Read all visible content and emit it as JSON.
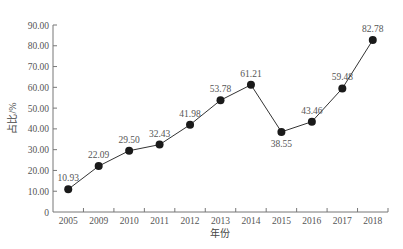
{
  "chart_data": {
    "type": "line",
    "title": "",
    "xlabel": "年份",
    "ylabel": "占比/%",
    "categories": [
      "2005",
      "2009",
      "2010",
      "2011",
      "2012",
      "2013",
      "2014",
      "2015",
      "2016",
      "2017",
      "2018"
    ],
    "series": [
      {
        "name": "占比",
        "values": [
          10.93,
          22.09,
          29.5,
          32.43,
          41.98,
          53.78,
          61.21,
          38.55,
          43.46,
          59.48,
          82.78
        ],
        "labels": [
          "10.93",
          "22.09",
          "29.50",
          "32.43",
          "41.98",
          "53.78",
          "61.21",
          "38.55",
          "43.46",
          "59.48",
          "82.78"
        ],
        "label_position": [
          "above",
          "above",
          "above",
          "above",
          "above",
          "above",
          "above",
          "below",
          "above",
          "above",
          "above"
        ]
      }
    ],
    "ylim": [
      0,
      90
    ],
    "yticks": [
      "0",
      "10.00",
      "20.00",
      "30.00",
      "40.00",
      "50.00",
      "60.00",
      "70.00",
      "80.00",
      "90.00"
    ],
    "ytick_values": [
      0,
      10,
      20,
      30,
      40,
      50,
      60,
      70,
      80,
      90
    ],
    "grid": false,
    "legend": "none",
    "marker": "filled-circle",
    "colors": {
      "line": "#333333",
      "marker": "#1a1a1a",
      "axis": "#777777",
      "text": "#555555"
    }
  }
}
